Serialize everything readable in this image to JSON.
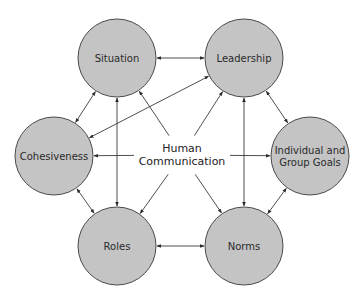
{
  "diagram": {
    "center": {
      "line1": "Human",
      "line2": "Communication",
      "x": 182,
      "y": 155
    },
    "nodes": [
      {
        "id": "situation",
        "lines": [
          "Situation"
        ],
        "cx": 117,
        "cy": 58,
        "r": 39
      },
      {
        "id": "leadership",
        "lines": [
          "Leadership"
        ],
        "cx": 244,
        "cy": 58,
        "r": 39
      },
      {
        "id": "cohesiveness",
        "lines": [
          "Cohesiveness"
        ],
        "cx": 54,
        "cy": 156,
        "r": 39
      },
      {
        "id": "goals",
        "lines": [
          "Individual and",
          "Group Goals"
        ],
        "cx": 310,
        "cy": 156,
        "r": 39
      },
      {
        "id": "roles",
        "lines": [
          "Roles"
        ],
        "cx": 117,
        "cy": 246,
        "r": 39
      },
      {
        "id": "norms",
        "lines": [
          "Norms"
        ],
        "cx": 244,
        "cy": 246,
        "r": 39
      }
    ],
    "edges": [
      {
        "from": "situation",
        "to": "leadership",
        "type": "double"
      },
      {
        "from": "situation",
        "to": "cohesiveness",
        "type": "double"
      },
      {
        "from": "leadership",
        "to": "goals",
        "type": "double"
      },
      {
        "from": "cohesiveness",
        "to": "roles",
        "type": "double"
      },
      {
        "from": "goals",
        "to": "norms",
        "type": "double"
      },
      {
        "from": "roles",
        "to": "norms",
        "type": "double"
      },
      {
        "from": "situation",
        "to": "roles",
        "type": "double"
      },
      {
        "from": "leadership",
        "to": "norms",
        "type": "double"
      },
      {
        "from": "cohesiveness",
        "to": "leadership",
        "type": "double"
      },
      {
        "from": "center",
        "to": "situation",
        "type": "single"
      },
      {
        "from": "center",
        "to": "leadership",
        "type": "single"
      },
      {
        "from": "center",
        "to": "roles",
        "type": "single"
      },
      {
        "from": "center",
        "to": "norms",
        "type": "single"
      },
      {
        "from": "center",
        "to": "cohesiveness",
        "type": "single"
      },
      {
        "from": "center",
        "to": "goals",
        "type": "single"
      }
    ],
    "colors": {
      "node_fill": "#c4c4c4",
      "node_stroke": "#4a4a4a",
      "line": "#3a3a3a",
      "background": "#ffffff"
    }
  }
}
